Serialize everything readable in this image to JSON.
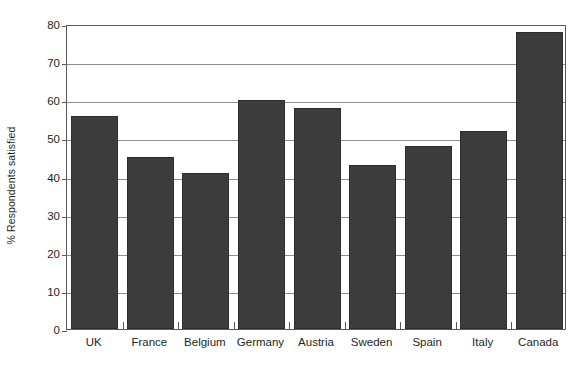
{
  "chart_data": {
    "type": "bar",
    "title": "",
    "subtitle": "",
    "xlabel": "",
    "ylabel": "% Respondents satisfied",
    "categories": [
      "UK",
      "France",
      "Belgium",
      "Germany",
      "Austria",
      "Sweden",
      "Spain",
      "Italy",
      "Canada"
    ],
    "values": [
      56,
      45,
      41,
      60,
      58,
      43,
      48,
      52,
      78
    ],
    "series": [
      {
        "name": "% Respondents satisfied",
        "values": [
          56,
          45,
          41,
          60,
          58,
          43,
          48,
          52,
          78
        ]
      }
    ],
    "ylim": [
      0,
      80
    ],
    "xlim": [
      0,
      9
    ],
    "y_ticks": [
      0,
      10,
      20,
      30,
      40,
      50,
      60,
      70,
      80
    ],
    "y_tick_labels": [
      "0",
      "10",
      "20",
      "30",
      "40",
      "50",
      "60",
      "70",
      "80"
    ],
    "grid": "horizontal",
    "legend": "none",
    "bar_color": "#3c3c3c",
    "gridline_color": "#8d8e90",
    "frame_color": "#58595b",
    "background_color": "#ffffff",
    "text_color": "#231f20",
    "annotations": []
  },
  "axis": {
    "y_title": "% Respondents satisfied"
  }
}
